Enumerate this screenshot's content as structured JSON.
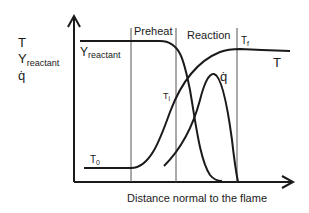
{
  "diagram": {
    "type": "premixed flame structure",
    "y_axis_labels": {
      "line1": "T",
      "line2_main": "Y",
      "line2_sub": "reactant",
      "line3": "q̇"
    },
    "x_axis_label": "Distance normal to the flame",
    "zones": [
      {
        "label": "Preheat"
      },
      {
        "label": "Reaction"
      }
    ],
    "curve_labels": {
      "reactant_main": "Y",
      "reactant_sub": "reactant",
      "temperature": "T",
      "heat_release": "q̇",
      "t0_main": "T",
      "t0_sub": "0",
      "ti_main": "T",
      "ti_sub": "i",
      "tf_main": "T",
      "tf_sub": "f"
    },
    "colors": {
      "line": "#1a1a1a",
      "divider": "#555555",
      "background": "#ffffff"
    }
  }
}
